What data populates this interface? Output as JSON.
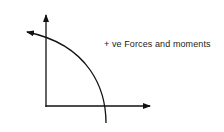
{
  "diagram": {
    "label": "+ ve Forces and moments",
    "elements": [
      {
        "type": "axis",
        "direction": "vertical-up"
      },
      {
        "type": "axis",
        "direction": "horizontal-right"
      },
      {
        "type": "arc-arrow",
        "direction": "counter-clockwise"
      }
    ],
    "colors": {
      "stroke": "#111111",
      "background": "#ffffff"
    }
  }
}
